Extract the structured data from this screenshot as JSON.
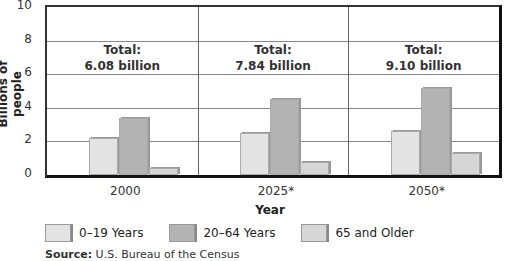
{
  "chart_data": {
    "type": "bar",
    "title": "",
    "xlabel": "Year",
    "ylabel": "Billions of people",
    "ylim": [
      0,
      10
    ],
    "yticks": [
      0,
      2,
      4,
      6,
      8,
      10
    ],
    "categories": [
      "2000",
      "2025*",
      "2050*"
    ],
    "series": [
      {
        "name": "0–19 Years",
        "color": "#e3e3e3",
        "values": [
          2.2,
          2.5,
          2.6
        ]
      },
      {
        "name": "20–64 Years",
        "color": "#b3b3b3",
        "values": [
          3.4,
          4.5,
          5.2
        ]
      },
      {
        "name": "65 and Older",
        "color": "#d6d6d6",
        "values": [
          0.4,
          0.8,
          1.3
        ]
      }
    ],
    "annotations": [
      {
        "category": "2000",
        "line1": "Total:",
        "line2": "6.08 billion"
      },
      {
        "category": "2025*",
        "line1": "Total:",
        "line2": "7.84 billion"
      },
      {
        "category": "2050*",
        "line1": "Total:",
        "line2": "9.10 billion"
      }
    ],
    "grid": true,
    "legend_position": "bottom"
  },
  "source": {
    "label": "Source:",
    "text": " U.S. Bureau of the Census"
  }
}
